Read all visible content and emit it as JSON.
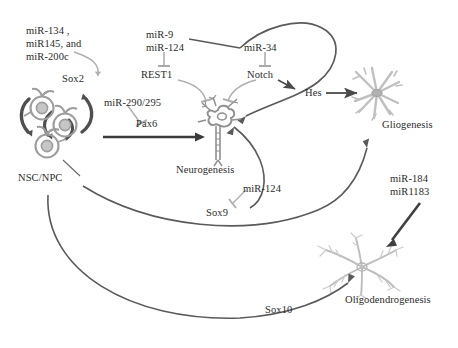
{
  "figure": {
    "type": "pathway-diagram",
    "background": "#ffffff",
    "colors": {
      "text": "#2b2b2b",
      "dark_arrow": "#4a4a4a",
      "black_arrow": "#333333",
      "gray_inhibitor": "#a9a9a9",
      "cell_gray": "#9a9a9a",
      "cell_light": "#b9b9b9",
      "nsc_fill": "#c9c9c9"
    }
  },
  "nodes": {
    "mir_134_group": {
      "line1": "miR-134 ,",
      "line2": "miR145, and",
      "line3": "miR-200c"
    },
    "sox2": "Sox2",
    "nsc_npc": "NSC/NPC",
    "mir_290_295": "miR-290/295",
    "pax6": "Pax6",
    "neurogenesis": "Neurogenesis",
    "mir_9": "miR-9",
    "mir_124_top": "miR-124",
    "rest1": "REST1",
    "mir_34": "miR-34",
    "notch": "Notch",
    "hes": "Hes",
    "gliogenesis": "Gliogenesis",
    "mir_124_sox9": "miR-124",
    "sox9": "Sox9",
    "mir_184": "miR-184",
    "mir_1183": "miR1183",
    "oligodendrogenesis": "Oligodendrogenesis",
    "sox10": "Sox10"
  },
  "edges": [
    {
      "from": "mir_134_group",
      "to": "sox2",
      "kind": "inhibition-curve",
      "style": "gray"
    },
    {
      "from": "sox2",
      "to": "nsc_npc",
      "kind": "self-renewal",
      "style": "black-thick"
    },
    {
      "from": "mir_290_295",
      "to": "pax6",
      "kind": "inhibition",
      "style": "gray-tbar"
    },
    {
      "from": "nsc_npc",
      "to": "neurogenesis",
      "kind": "promotion",
      "label": "Pax6",
      "style": "black-thick-arrow"
    },
    {
      "from": "mir_9",
      "to": "rest1",
      "kind": "inhibition",
      "style": "gray-tbar"
    },
    {
      "from": "mir_124_top",
      "to": "rest1",
      "kind": "inhibition",
      "style": "gray-tbar"
    },
    {
      "from": "rest1",
      "to": "neurogenesis",
      "kind": "inhibition",
      "style": "gray-tbar-curve"
    },
    {
      "from": "mir_34",
      "to": "notch",
      "kind": "inhibition",
      "style": "gray-tbar"
    },
    {
      "from": "notch",
      "to": "hes",
      "kind": "promotion",
      "style": "dark-arrow"
    },
    {
      "from": "notch",
      "to": "neurogenesis",
      "kind": "inhibition",
      "style": "gray-tbar-curve"
    },
    {
      "from": "mir_9",
      "to": "notch",
      "kind": "loop-inhibition",
      "style": "dark-loop"
    },
    {
      "from": "hes",
      "to": "gliogenesis",
      "kind": "promotion",
      "style": "dark-arrow"
    },
    {
      "from": "mir_124_sox9",
      "to": "sox9",
      "kind": "inhibition",
      "style": "gray-tbar"
    },
    {
      "from": "sox9",
      "to": "neurogenesis",
      "kind": "promotion-curve",
      "style": "dark-curve"
    },
    {
      "from": "nsc_npc",
      "to": "gliogenesis",
      "kind": "promotion-curve",
      "style": "dark-curve"
    },
    {
      "from": "nsc_npc",
      "to": "oligodendrogenesis",
      "kind": "promotion-curve",
      "label": "Sox10",
      "style": "dark-curve"
    },
    {
      "from": "mir_184",
      "to": "oligodendrogenesis",
      "kind": "promotion",
      "style": "black-thick-arrow"
    },
    {
      "from": "mir_1183",
      "to": "oligodendrogenesis",
      "kind": "promotion",
      "style": "black-thick-arrow"
    }
  ],
  "cells": [
    {
      "name": "neural-stem-cells",
      "count": 3,
      "label": "NSC/NPC"
    },
    {
      "name": "neuron",
      "label": "Neurogenesis"
    },
    {
      "name": "astrocyte",
      "label": "Gliogenesis"
    },
    {
      "name": "oligodendrocyte",
      "label": "Oligodendrogenesis"
    }
  ]
}
